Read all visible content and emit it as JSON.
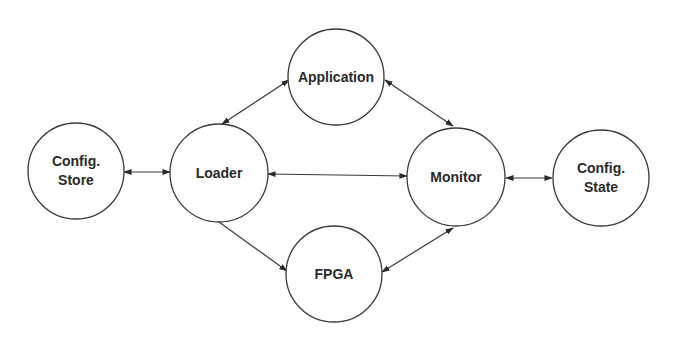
{
  "diagram": {
    "type": "component-interaction",
    "colors": {
      "background": "#ffffff",
      "stroke": "#3a3a3a",
      "text": "#2a2a2a"
    },
    "nodes": [
      {
        "id": "config_store",
        "lines": [
          "Config.",
          "Store"
        ],
        "cx": 76,
        "cy": 171,
        "r": 48
      },
      {
        "id": "loader",
        "lines": [
          "Loader"
        ],
        "cx": 219,
        "cy": 173,
        "r": 49
      },
      {
        "id": "application",
        "lines": [
          "Application"
        ],
        "cx": 336,
        "cy": 77,
        "r": 48
      },
      {
        "id": "fpga",
        "lines": [
          "FPGA"
        ],
        "cx": 334,
        "cy": 274,
        "r": 48
      },
      {
        "id": "monitor",
        "lines": [
          "Monitor"
        ],
        "cx": 456,
        "cy": 177,
        "r": 49
      },
      {
        "id": "config_state",
        "lines": [
          "Config.",
          "State"
        ],
        "cx": 601,
        "cy": 178,
        "r": 48
      }
    ],
    "edges": [
      {
        "from": "config_store",
        "to": "loader",
        "direction": "both",
        "x1": 124,
        "y1": 172,
        "x2": 170,
        "y2": 172
      },
      {
        "from": "loader",
        "to": "application",
        "direction": "both",
        "x1": 222,
        "y1": 124,
        "x2": 289,
        "y2": 80
      },
      {
        "from": "loader",
        "to": "monitor",
        "direction": "both",
        "x1": 268,
        "y1": 174,
        "x2": 407,
        "y2": 176
      },
      {
        "from": "loader",
        "to": "fpga",
        "direction": "forward",
        "x1": 219,
        "y1": 222,
        "x2": 287,
        "y2": 271
      },
      {
        "from": "application",
        "to": "monitor",
        "direction": "both",
        "x1": 385,
        "y1": 80,
        "x2": 453,
        "y2": 126
      },
      {
        "from": "monitor",
        "to": "fpga",
        "direction": "both",
        "x1": 453,
        "y1": 228,
        "x2": 382,
        "y2": 272
      },
      {
        "from": "monitor",
        "to": "config_state",
        "direction": "both",
        "x1": 506,
        "y1": 178,
        "x2": 552,
        "y2": 178
      }
    ]
  }
}
